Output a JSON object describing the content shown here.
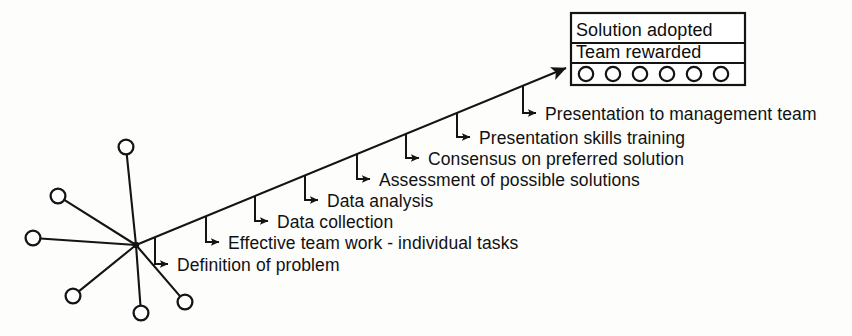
{
  "diagram": {
    "ink_color": "#141414",
    "background_color": "#fdfdfb",
    "main_arrow": {
      "name": "progress-arrow",
      "from": [
        136,
        245
      ],
      "to": [
        566,
        68
      ],
      "description": "Upward diagonal progress arrow pointing to outcome box"
    },
    "stages": [
      {
        "index": 1,
        "label": "Definition of problem",
        "stem_x": 155,
        "stem_top_y": 241,
        "arrow_y": 264,
        "text_x": 170,
        "text_y": 271
      },
      {
        "index": 2,
        "label": "Effective team work - individual tasks",
        "stem_x": 206,
        "stem_top_y": 221,
        "arrow_y": 242,
        "text_x": 221,
        "text_y": 249
      },
      {
        "index": 3,
        "label": "Data collection",
        "stem_x": 255,
        "stem_top_y": 200,
        "arrow_y": 221,
        "text_x": 270,
        "text_y": 228
      },
      {
        "index": 4,
        "label": "Data analysis",
        "stem_x": 305,
        "stem_top_y": 180,
        "arrow_y": 200,
        "text_x": 320,
        "text_y": 207
      },
      {
        "index": 5,
        "label": "Assessment of possible solutions",
        "stem_x": 357,
        "stem_top_y": 158,
        "arrow_y": 179,
        "text_x": 372,
        "text_y": 186
      },
      {
        "index": 6,
        "label": "Consensus on preferred solution",
        "stem_x": 406,
        "stem_top_y": 138,
        "arrow_y": 158,
        "text_x": 421,
        "text_y": 165
      },
      {
        "index": 7,
        "label": "Presentation skills training",
        "stem_x": 457,
        "stem_top_y": 117,
        "arrow_y": 137,
        "text_x": 472,
        "text_y": 144
      },
      {
        "index": 8,
        "label": "Presentation to management team",
        "stem_x": 523,
        "stem_top_y": 90,
        "arrow_y": 113,
        "text_x": 538,
        "text_y": 120
      }
    ],
    "outcome_box": {
      "name": "outcome-box",
      "x": 571,
      "y": 13,
      "width": 174,
      "height": 72,
      "line_1": "Solution adopted",
      "line_2": "Team rewarded",
      "divider_1_y": 43,
      "divider_2_y": 63,
      "team_members_count": 6,
      "team_member_radius": 7.2,
      "team_member_cy": 74,
      "team_member_cx": [
        586,
        613,
        640,
        667,
        694,
        721
      ]
    },
    "team_network": {
      "name": "team-network-starburst",
      "hub": [
        136,
        245
      ],
      "hub_dot_radius": 3.2,
      "member_radius": 7.4,
      "members": [
        {
          "name": "team-node-top",
          "cx": 126,
          "cy": 147
        },
        {
          "name": "team-node-upper-left",
          "cx": 58,
          "cy": 196
        },
        {
          "name": "team-node-left",
          "cx": 33,
          "cy": 238
        },
        {
          "name": "team-node-lower-left",
          "cx": 73,
          "cy": 296
        },
        {
          "name": "team-node-bottom",
          "cx": 141,
          "cy": 313
        },
        {
          "name": "team-node-lower-right",
          "cx": 185,
          "cy": 302
        }
      ]
    }
  },
  "chart_data": {
    "type": "diagram",
    "categories": [
      "Definition of problem",
      "Effective team work - individual tasks",
      "Data collection",
      "Data analysis",
      "Assessment of possible solutions",
      "Consensus on preferred solution",
      "Presentation skills training",
      "Presentation to management team"
    ],
    "values": [
      1,
      2,
      3,
      4,
      5,
      6,
      7,
      8
    ],
    "endpoint": [
      "Solution adopted",
      "Team rewarded"
    ],
    "xlabel": "",
    "ylabel": "Progress",
    "legend": []
  }
}
